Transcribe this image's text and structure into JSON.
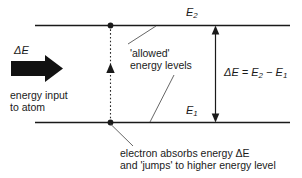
{
  "figure": {
    "background_color": "#ffffff",
    "line_color": "#1a1a1a",
    "text_color": "#1a1a1a"
  },
  "labels": {
    "upper_level": "E",
    "upper_level_sub": "2",
    "lower_level": "E",
    "lower_level_sub": "1",
    "delta_e": "ΔE",
    "equation_lhs": "ΔE = E",
    "equation_sub1": "2",
    "equation_mid": " − E",
    "equation_sub2": "1",
    "allowed_line1": "'allowed'",
    "allowed_line2": "energy levels",
    "energy_input_line1": "energy input",
    "energy_input_line2": "to atom",
    "caption_line1": "electron absorbs energy ΔE",
    "caption_line2": "and 'jumps' to higher energy level"
  },
  "graphics": {
    "upper_energy_line": "horizontal-line-upper",
    "lower_energy_line": "horizontal-line-lower",
    "transition_arrow": "dotted-vertical-up-arrow",
    "gap_arrow": "double-headed-vertical-arrow",
    "input_arrow": "thick-block-right-arrow",
    "leader_allowed_upper": "leader-line-to-upper-level",
    "leader_allowed_lower": "leader-line-to-lower-level",
    "leader_caption": "leader-line-to-electron-dot",
    "electron_dot_upper": "electron-dot-upper",
    "electron_dot_lower": "electron-dot-lower"
  }
}
